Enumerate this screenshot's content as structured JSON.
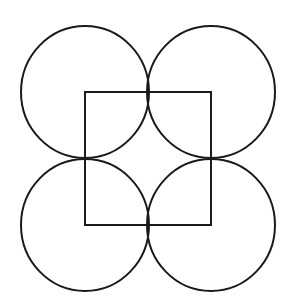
{
  "diagram": {
    "stroke_color": "#1a1a1a",
    "background_color": "#ffffff",
    "square": {
      "x": 85,
      "y": 92,
      "width": 126,
      "height": 133
    },
    "circles": [
      {
        "id": "top-left",
        "cx": 85,
        "cy": 92,
        "rx": 64,
        "ry": 66
      },
      {
        "id": "top-right",
        "cx": 211,
        "cy": 92,
        "rx": 64,
        "ry": 66
      },
      {
        "id": "bottom-left",
        "cx": 85,
        "cy": 225,
        "rx": 64,
        "ry": 66
      },
      {
        "id": "bottom-right",
        "cx": 211,
        "cy": 225,
        "rx": 64,
        "ry": 66
      }
    ]
  }
}
